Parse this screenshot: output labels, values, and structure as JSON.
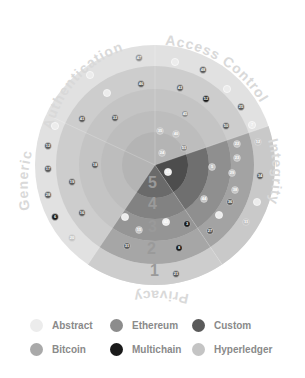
{
  "chart_data": {
    "type": "radial-sector-diagram",
    "center": [
      155,
      165
    ],
    "ring_radii": [
      120,
      99,
      76,
      54,
      33
    ],
    "ring_labels": [
      "1",
      "2",
      "3",
      "4",
      "5"
    ],
    "sectors": [
      {
        "name": "Access Control",
        "start": 0,
        "end": 71,
        "highlight": false
      },
      {
        "name": "Integrity",
        "start": 71,
        "end": 146,
        "highlight": true
      },
      {
        "name": "Privacy",
        "start": 146,
        "end": 214,
        "highlight": true
      },
      {
        "name": "Generic",
        "start": 214,
        "end": 295,
        "highlight": false
      },
      {
        "name": "Authentication",
        "start": 295,
        "end": 360,
        "highlight": false
      }
    ],
    "legend": [
      {
        "label": "Abstract",
        "color": "#ececec"
      },
      {
        "label": "Ethereum",
        "color": "#8c8c8c"
      },
      {
        "label": "Custom",
        "color": "#5a5a5a"
      },
      {
        "label": "Bitcoin",
        "color": "#a9a9a9"
      },
      {
        "label": "Multichain",
        "color": "#1a1a1a"
      },
      {
        "label": "Hyperledger",
        "color": "#c4c4c4"
      }
    ],
    "points": [
      {
        "x": 139,
        "y": 58,
        "label": "47",
        "type": "Ethereum"
      },
      {
        "x": 90,
        "y": 75,
        "label": "",
        "type": "Abstract"
      },
      {
        "x": 141,
        "y": 84,
        "label": "46",
        "type": "Custom"
      },
      {
        "x": 107,
        "y": 93,
        "label": "",
        "type": "Abstract"
      },
      {
        "x": 82,
        "y": 119,
        "label": "41",
        "type": "Custom"
      },
      {
        "x": 115,
        "y": 118,
        "label": "33",
        "type": "Custom"
      },
      {
        "x": 55,
        "y": 126,
        "label": "",
        "type": "Abstract"
      },
      {
        "x": 175,
        "y": 62,
        "label": "",
        "type": "Abstract"
      },
      {
        "x": 203,
        "y": 70,
        "label": "48",
        "type": "Custom"
      },
      {
        "x": 180,
        "y": 88,
        "label": "43",
        "type": "Custom"
      },
      {
        "x": 206,
        "y": 99,
        "label": "52",
        "type": "Multichain"
      },
      {
        "x": 227,
        "y": 89,
        "label": "",
        "type": "Abstract"
      },
      {
        "x": 241,
        "y": 107,
        "label": "25",
        "type": "Custom"
      },
      {
        "x": 185,
        "y": 114,
        "label": "45",
        "type": "Ethereum"
      },
      {
        "x": 226,
        "y": 126,
        "label": "50",
        "type": "Custom"
      },
      {
        "x": 252,
        "y": 125,
        "label": "7",
        "type": "Abstract"
      },
      {
        "x": 160,
        "y": 131,
        "label": "35",
        "type": "Hyperledger"
      },
      {
        "x": 176,
        "y": 134,
        "label": "40",
        "type": "Hyperledger"
      },
      {
        "x": 184,
        "y": 148,
        "label": "51",
        "type": "Ethereum"
      },
      {
        "x": 162,
        "y": 153,
        "label": "24",
        "type": "Hyperledger"
      },
      {
        "x": 48,
        "y": 146,
        "label": "12",
        "type": "Custom"
      },
      {
        "x": 48,
        "y": 169,
        "label": "17",
        "type": "Custom"
      },
      {
        "x": 95,
        "y": 165,
        "label": "18",
        "type": "Custom"
      },
      {
        "x": 72,
        "y": 182,
        "label": "19",
        "type": "Custom"
      },
      {
        "x": 48,
        "y": 195,
        "label": "28",
        "type": "Custom"
      },
      {
        "x": 55,
        "y": 217,
        "label": "6",
        "type": "Multichain"
      },
      {
        "x": 82,
        "y": 213,
        "label": "16",
        "type": "Custom"
      },
      {
        "x": 72,
        "y": 238,
        "label": "20",
        "type": "Hyperledger"
      },
      {
        "x": 237,
        "y": 144,
        "label": "22",
        "type": "Hyperledger"
      },
      {
        "x": 258,
        "y": 142,
        "label": "12",
        "type": "Hyperledger"
      },
      {
        "x": 237,
        "y": 158,
        "label": "23",
        "type": "Hyperledger"
      },
      {
        "x": 212,
        "y": 167,
        "label": "5",
        "type": "Hyperledger"
      },
      {
        "x": 232,
        "y": 173,
        "label": "29",
        "type": "Hyperledger"
      },
      {
        "x": 260,
        "y": 176,
        "label": "34",
        "type": "Custom"
      },
      {
        "x": 235,
        "y": 190,
        "label": "38",
        "type": "Hyperledger"
      },
      {
        "x": 204,
        "y": 199,
        "label": "44",
        "type": "Hyperledger"
      },
      {
        "x": 230,
        "y": 202,
        "label": "36",
        "type": "Custom"
      },
      {
        "x": 257,
        "y": 202,
        "label": "",
        "type": "Abstract"
      },
      {
        "x": 219,
        "y": 215,
        "label": "",
        "type": "Abstract"
      },
      {
        "x": 246,
        "y": 222,
        "label": "11",
        "type": "Hyperledger"
      },
      {
        "x": 168,
        "y": 172,
        "label": "13",
        "type": "Abstract"
      },
      {
        "x": 125,
        "y": 217,
        "label": "",
        "type": "Abstract"
      },
      {
        "x": 166,
        "y": 222,
        "label": "42",
        "type": "Abstract"
      },
      {
        "x": 187,
        "y": 224,
        "label": "3",
        "type": "Multichain"
      },
      {
        "x": 139,
        "y": 230,
        "label": "15",
        "type": "Hyperledger"
      },
      {
        "x": 210,
        "y": 231,
        "label": "27",
        "type": "Custom"
      },
      {
        "x": 127,
        "y": 246,
        "label": "31",
        "type": "Custom"
      },
      {
        "x": 179,
        "y": 248,
        "label": "8",
        "type": "Multichain"
      },
      {
        "x": 176,
        "y": 274,
        "label": "21",
        "type": "Custom"
      }
    ]
  },
  "legend": {
    "items": [
      {
        "label": "Abstract",
        "color": "#ececec"
      },
      {
        "label": "Ethereum",
        "color": "#8c8c8c"
      },
      {
        "label": "Custom",
        "color": "#5a5a5a"
      },
      {
        "label": "Bitcoin",
        "color": "#a9a9a9"
      },
      {
        "label": "Multichain",
        "color": "#1a1a1a"
      },
      {
        "label": "Hyperledger",
        "color": "#c4c4c4"
      }
    ]
  },
  "labels": {
    "access_control": "Access Control",
    "integrity": "Integrity",
    "privacy": "Privacy",
    "generic": "Generic",
    "authentication": "Authentication",
    "ring1": "1",
    "ring2": "2",
    "ring3": "3",
    "ring4": "4",
    "ring5": "5"
  }
}
